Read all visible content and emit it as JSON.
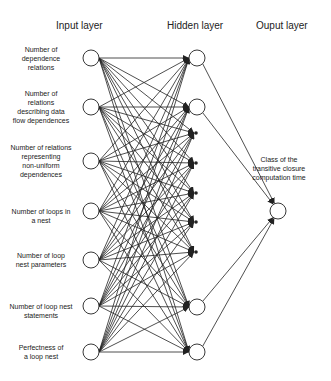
{
  "headers": {
    "input": "Input layer",
    "hidden": "Hidden layer",
    "output": "Ouput layer"
  },
  "input_nodes": [
    {
      "label_lines": [
        "Number of",
        "dependence",
        "relations"
      ]
    },
    {
      "label_lines": [
        "Number of",
        "relations",
        "describing data",
        "flow dependences"
      ]
    },
    {
      "label_lines": [
        "Number of relations",
        "representing",
        "non-uniform",
        "dependences"
      ]
    },
    {
      "label_lines": [
        "Number of loops in",
        "a nest"
      ]
    },
    {
      "label_lines": [
        "Number of loop",
        "nest parameters"
      ]
    },
    {
      "label_lines": [
        "Number of loop nest",
        "statements"
      ]
    },
    {
      "label_lines": [
        "Perfectness of",
        "a loop nest"
      ]
    }
  ],
  "hidden": {
    "visible_nodes_top": 2,
    "visible_nodes_bottom": 2,
    "ellipsis_dots": 5
  },
  "output_node": {
    "label_lines": [
      "Class of the",
      "transitive closure",
      "computation time"
    ]
  },
  "colors": {
    "stroke": "#222222",
    "node_fill": "#ffffff",
    "text": "#222222"
  }
}
